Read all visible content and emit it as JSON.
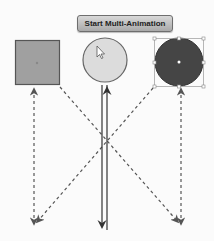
{
  "button": {
    "label": "Start Multi-Animation"
  },
  "shapes": {
    "square": {
      "fill": "#a0a0a0",
      "stroke": "#555555"
    },
    "light_circle": {
      "fill": "#dcdcdc",
      "stroke": "#666666"
    },
    "dark_circle": {
      "fill": "#454545",
      "stroke": "#333333",
      "selected": true
    }
  },
  "colors": {
    "arrow": "#555555",
    "handle": "#888888"
  }
}
